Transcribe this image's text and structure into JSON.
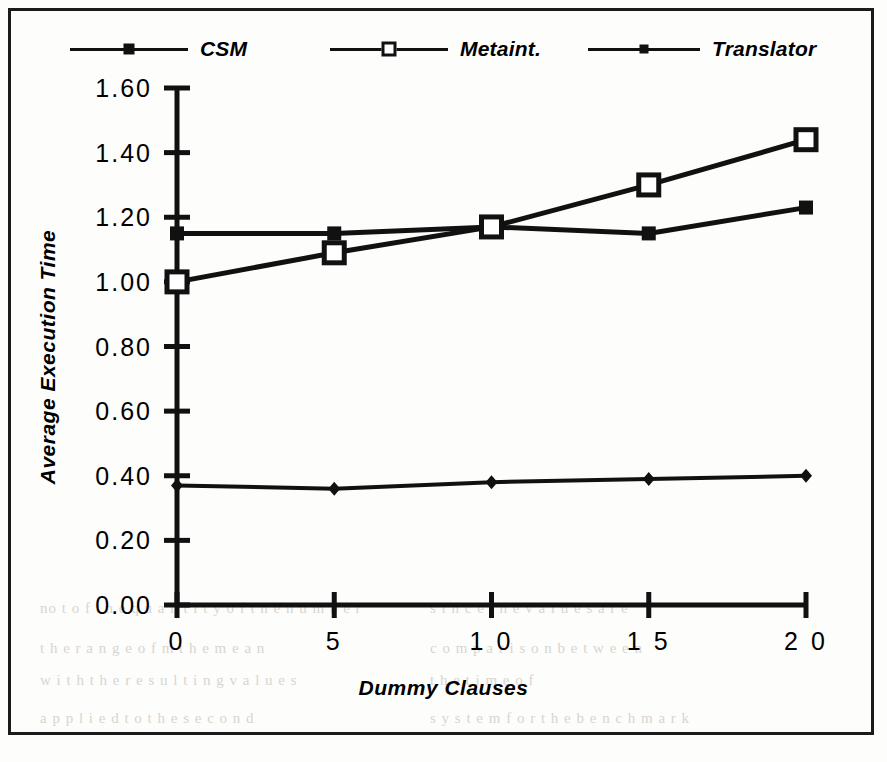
{
  "figure": {
    "background_color": "#fdfdfc",
    "frame_color": "#1b1b1b",
    "ink_color": "#111111"
  },
  "legend": {
    "position": "top",
    "entries": [
      {
        "label": "CSM",
        "marker": "filled-square-marker",
        "marker_name": "csm-marker"
      },
      {
        "label": "Metaint.",
        "marker": "open-square-marker",
        "marker_name": "metaint-marker"
      },
      {
        "label": "Translator",
        "marker": "diamond-marker",
        "marker_name": "translator-marker"
      }
    ]
  },
  "axes": {
    "ylabel": "Average Execution Time",
    "xlabel": "Dummy Clauses",
    "ytick_labels": [
      "1.60",
      "1.40",
      "1.20",
      "1.00",
      "0.80",
      "0.60",
      "0.40",
      "0.20",
      "0.00"
    ],
    "xtick_labels": [
      "0",
      "5",
      "1 0",
      "1 5",
      "2 0"
    ]
  },
  "bleed_text": [
    {
      "text": "no t o f t h e  q u a n t i t y  o f  t h e  n u m b e r",
      "x": 40,
      "y": 600
    },
    {
      "text": "s i n c e  t h e  v a l u e s  a r e",
      "x": 430,
      "y": 600
    },
    {
      "text": "t h e  r a n g e  o f  m  t h e  m e a n",
      "x": 40,
      "y": 640
    },
    {
      "text": "w i t h  t h e  r e s u l t i n g  v a l u e s",
      "x": 40,
      "y": 672
    },
    {
      "text": "c o m p a r i s o n  b e t w e e n",
      "x": 430,
      "y": 640
    },
    {
      "text": "a p p l i e d  t o  t h e  s e c o n d",
      "x": 40,
      "y": 710
    },
    {
      "text": "s y s t e m  f o r  t h e  b e n c h m a r k",
      "x": 430,
      "y": 710
    },
    {
      "text": "t h e  t i m e  o f",
      "x": 430,
      "y": 672
    }
  ],
  "chart_data": {
    "type": "line",
    "title": "",
    "xlabel": "Dummy Clauses",
    "ylabel": "Average Execution Time",
    "x": [
      0,
      5,
      10,
      15,
      20
    ],
    "xlim": [
      0,
      20
    ],
    "ylim": [
      0.0,
      1.6
    ],
    "ytick_values": [
      0.0,
      0.2,
      0.4,
      0.6,
      0.8,
      1.0,
      1.2,
      1.4,
      1.6
    ],
    "xtick_values": [
      0,
      5,
      10,
      15,
      20
    ],
    "grid": false,
    "legend_position": "top",
    "series": [
      {
        "name": "CSM",
        "marker": "filled-square",
        "values": [
          1.15,
          1.15,
          1.17,
          1.15,
          1.23
        ]
      },
      {
        "name": "Metaint.",
        "marker": "open-square",
        "values": [
          1.0,
          1.09,
          1.17,
          1.3,
          1.44
        ]
      },
      {
        "name": "Translator",
        "marker": "diamond",
        "values": [
          0.37,
          0.36,
          0.38,
          0.39,
          0.4
        ]
      }
    ]
  }
}
